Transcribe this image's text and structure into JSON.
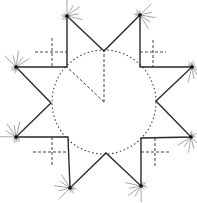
{
  "figure": {
    "colors": {
      "line": "#2a2a2a",
      "construction": "#444444",
      "background": "#ffffff"
    },
    "center": [
      104,
      102
    ],
    "circle_radius": 52,
    "polygon_points": [
      [
        67,
        16
      ],
      [
        104,
        51
      ],
      [
        140,
        15
      ],
      [
        140,
        67
      ],
      [
        192,
        67
      ],
      [
        156,
        101
      ],
      [
        191,
        137
      ],
      [
        141,
        138
      ],
      [
        141,
        186
      ],
      [
        106,
        153
      ],
      [
        70,
        188
      ],
      [
        68,
        137
      ],
      [
        16,
        137
      ],
      [
        51,
        103
      ],
      [
        16,
        67
      ],
      [
        67,
        67
      ]
    ],
    "outer_tips": [
      [
        67,
        16
      ],
      [
        140,
        15
      ],
      [
        192,
        67
      ],
      [
        191,
        137
      ],
      [
        141,
        186
      ],
      [
        70,
        188
      ],
      [
        16,
        137
      ],
      [
        16,
        67
      ]
    ],
    "dashed_radii": [
      [
        [
          104,
          102
        ],
        [
          104,
          51
        ]
      ],
      [
        [
          104,
          102
        ],
        [
          67,
          67
        ]
      ]
    ],
    "dashed_crosses": [
      {
        "v": [
          52,
          38,
          67
        ],
        "h": [
          52,
          35,
          67
        ]
      },
      {
        "v": [
          153,
          40,
          67
        ],
        "h": [
          52,
          140,
          166
        ]
      },
      {
        "v": [
          52,
          137,
          166
        ],
        "h": [
          152,
          33,
          68
        ]
      },
      {
        "v": [
          155,
          138,
          166
        ],
        "h": [
          152,
          141,
          170
        ]
      }
    ]
  }
}
